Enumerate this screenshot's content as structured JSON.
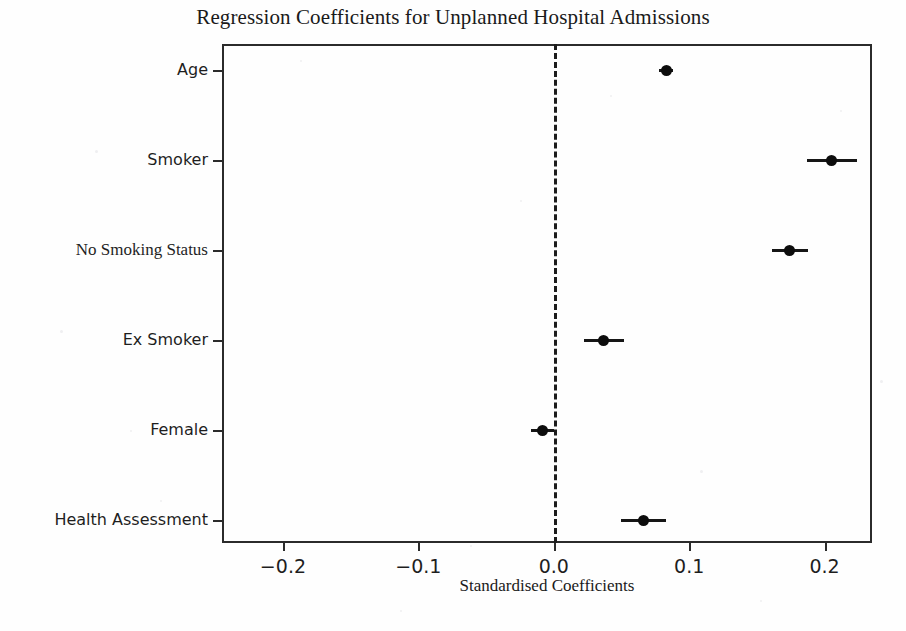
{
  "chart_data": {
    "type": "scatter",
    "title": "Regression Coefficients for Unplanned Hospital Admissions",
    "xlabel": "Standardised Coefficients",
    "ylabel": "",
    "xlim": [
      -0.245,
      0.235
    ],
    "xticks": [
      -0.2,
      -0.1,
      0.0,
      0.1,
      0.2
    ],
    "xticklabels": [
      "−0.2",
      "−0.1",
      "0.0",
      "0.1",
      "0.2"
    ],
    "categories": [
      "Age",
      "Smoker",
      "No Smoking Status",
      "Ex Smoker",
      "Female",
      "Health Assessment"
    ],
    "values": [
      0.083,
      0.205,
      0.174,
      0.037,
      -0.008,
      0.066
    ],
    "ci_low": [
      0.078,
      0.187,
      0.161,
      0.022,
      -0.017,
      0.05
    ],
    "ci_high": [
      0.088,
      0.224,
      0.188,
      0.052,
      0.0,
      0.083
    ],
    "reference_line": 0.0,
    "reference_line_style": "dashed",
    "grid": false,
    "legend": false,
    "marker_color": "#0d0d0d",
    "line_color": "#161616",
    "axis_color": "#2b2b2b",
    "background": "#fefefe"
  },
  "axis": {
    "y_label_fonts": [
      "sans",
      "sans",
      "serif",
      "sans",
      "sans",
      "sans"
    ]
  }
}
